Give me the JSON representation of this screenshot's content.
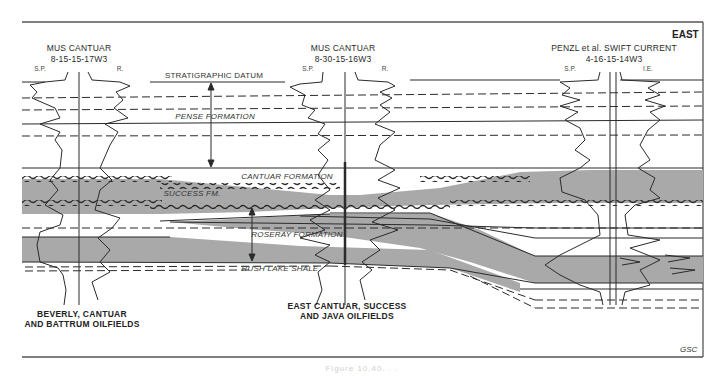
{
  "figure": {
    "direction_label": "EAST",
    "credit": "GSC",
    "caption": "Figure 10.40. . ."
  },
  "wells": [
    {
      "name": "MUS CANTUAR",
      "location": "8-15-15-17W3",
      "logs": [
        "S.P.",
        "R."
      ]
    },
    {
      "name": "MUS CANTUAR",
      "location": "8-30-15-16W3",
      "logs": [
        "S.P.",
        "R."
      ]
    },
    {
      "name": "PENZL et al. SWIFT CURRENT",
      "location": "4-16-15-14W3",
      "logs": [
        "S.P.",
        "I.E."
      ]
    }
  ],
  "datum": {
    "label": "STRATIGRAPHIC DATUM"
  },
  "formations": [
    {
      "id": "pense",
      "label": "PENSE FORMATION"
    },
    {
      "id": "cantuar",
      "label": "CANTUAR FORMATION"
    },
    {
      "id": "success",
      "label": "SUCCESS FM."
    },
    {
      "id": "roseray",
      "label": "ROSERAY FORMATION"
    },
    {
      "id": "rush_lake",
      "label": "RUSH LAKE SHALE"
    }
  ],
  "oilfields": [
    {
      "line1": "BEVERLY, CANTUAR",
      "line2": "AND BATTRUM OILFIELDS"
    },
    {
      "line1": "EAST CANTUAR, SUCCESS",
      "line2": "AND JAVA OILFIELDS"
    }
  ],
  "colors": {
    "fill": "#a9a9a9",
    "line": "#2b2b2b",
    "frame": "#555555"
  }
}
